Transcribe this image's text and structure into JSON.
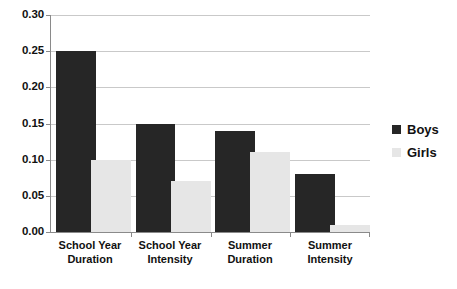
{
  "chart_data": {
    "type": "bar",
    "title": "",
    "xlabel": "",
    "ylabel": "",
    "ylim": [
      0.0,
      0.3
    ],
    "ytick_labels": [
      "0.30",
      "0.25",
      "0.20",
      "0.15",
      "0.10",
      "0.05",
      "0.00"
    ],
    "ytick_values": [
      0.3,
      0.25,
      0.2,
      0.15,
      0.1,
      0.05,
      0.0
    ],
    "grid": true,
    "legend_position": "right",
    "categories": [
      "School Year Duration",
      "School Year Intensity",
      "Summer Duration",
      "Summer Intensity"
    ],
    "category_lines": [
      [
        "School Year",
        "Duration"
      ],
      [
        "School Year",
        "Intensity"
      ],
      [
        "Summer",
        "Duration"
      ],
      [
        "Summer",
        "Intensity"
      ]
    ],
    "series": [
      {
        "name": "Boys",
        "color": "#262626",
        "values": [
          0.25,
          0.15,
          0.14,
          0.08
        ]
      },
      {
        "name": "Girls",
        "color": "#e6e6e6",
        "values": [
          0.1,
          0.07,
          0.11,
          0.01
        ]
      }
    ]
  },
  "legend": {
    "items": [
      {
        "label": "Boys",
        "color": "#262626"
      },
      {
        "label": "Girls",
        "color": "#e6e6e6"
      }
    ]
  },
  "colors": {
    "boys": "#262626",
    "girls": "#e6e6e6",
    "gridline": "#c9c9c9",
    "axis": "#8a8a8a",
    "text": "#111111",
    "background": "#ffffff"
  }
}
